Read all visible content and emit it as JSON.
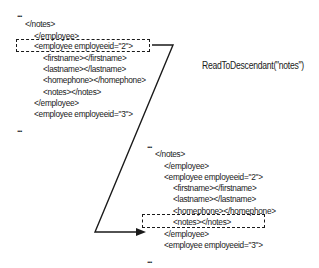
{
  "diagram": {
    "annotation": "ReadToDescendant(\"notes\")",
    "before": {
      "ellipsis_top": "...",
      "lines": [
        {
          "text": "</notes>",
          "indent": 0
        },
        {
          "text": "</employee>",
          "indent": 1
        },
        {
          "text": "<employee employeeid=\"2\">",
          "indent": 1,
          "highlighted": true
        },
        {
          "text": "<firstname></firstname>",
          "indent": 2
        },
        {
          "text": "<lastname></lastname>",
          "indent": 2
        },
        {
          "text": "<homephone></homephone>",
          "indent": 2
        },
        {
          "text": "<notes></notes>",
          "indent": 2
        },
        {
          "text": "</employee>",
          "indent": 1
        },
        {
          "text": "<employee employeeid=\"3\">",
          "indent": 1
        }
      ],
      "ellipsis_bottom": "..."
    },
    "after": {
      "ellipsis_top": "...",
      "lines": [
        {
          "text": "</notes>",
          "indent": 0
        },
        {
          "text": "</employee>",
          "indent": 1
        },
        {
          "text": "<employee employeeid=\"2\">",
          "indent": 1
        },
        {
          "text": "<firstname></firstname>",
          "indent": 2
        },
        {
          "text": "<lastname></lastname>",
          "indent": 2
        },
        {
          "text": "<homephone></homephone>",
          "indent": 2
        },
        {
          "text": "<notes></notes>",
          "indent": 2,
          "highlighted": true
        },
        {
          "text": "</employee>",
          "indent": 1
        },
        {
          "text": "<employee employeeid=\"3\">",
          "indent": 1
        }
      ],
      "ellipsis_bottom": "..."
    }
  }
}
